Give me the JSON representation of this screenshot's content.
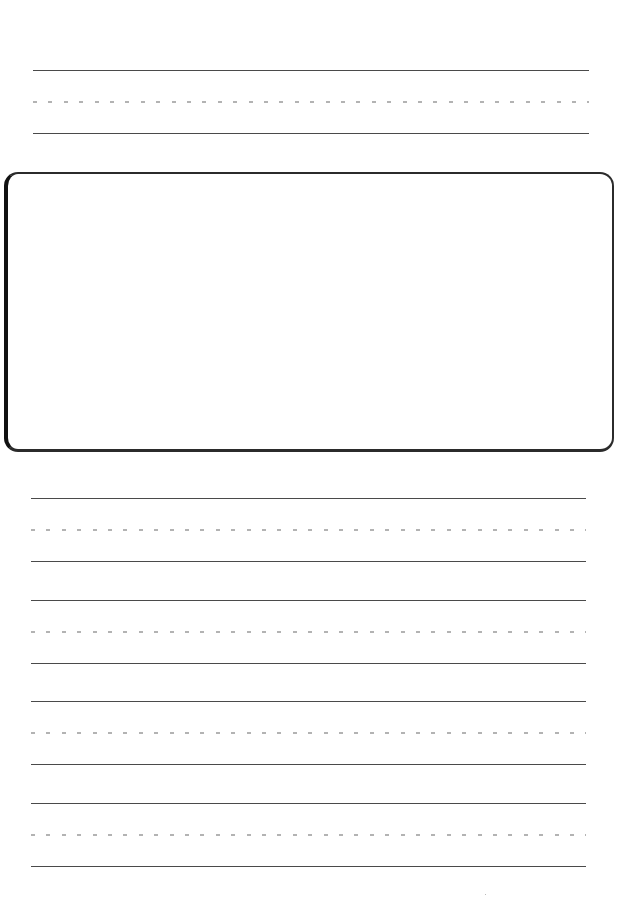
{
  "document": {
    "type": "handwriting-practice-sheet",
    "colors": {
      "solid_line": "#4a4a4a",
      "dashed_line": "#b3b3b3",
      "box_border": "#2b2b2b",
      "background": "#ffffff"
    },
    "top_lineset": {
      "top_y": 70,
      "mid_y": 102,
      "base_y": 133,
      "left_x": 33,
      "right_x": 589
    },
    "drawing_box": {
      "label": "",
      "x": 4,
      "y": 172,
      "width": 612,
      "height": 282
    },
    "writing_linesets": [
      {
        "top_y": 498,
        "mid_y": 529,
        "base_y": 560
      },
      {
        "top_y": 600,
        "mid_y": 631,
        "base_y": 662
      },
      {
        "top_y": 701,
        "mid_y": 733,
        "base_y": 764
      },
      {
        "top_y": 803,
        "mid_y": 834,
        "base_y": 866
      }
    ]
  }
}
